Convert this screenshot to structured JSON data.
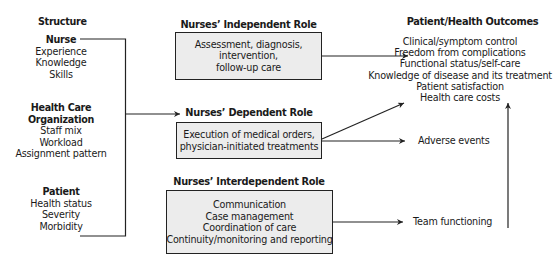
{
  "structure": {
    "heading": "Structure",
    "groups": [
      {
        "title": "Nurse",
        "items": [
          "Experience",
          "Knowledge",
          "Skills"
        ]
      },
      {
        "title_lines": [
          "Health Care",
          "Organization"
        ],
        "items": [
          "Staff mix",
          "Workload",
          "Assignment pattern"
        ]
      },
      {
        "title": "Patient",
        "items": [
          "Health status",
          "Severity",
          "Morbidity"
        ]
      }
    ]
  },
  "roles": {
    "independent": {
      "title": "Nurses’ Independent Role",
      "lines": [
        "Assessment, diagnosis,",
        "intervention,",
        "follow-up care"
      ]
    },
    "dependent": {
      "title": "Nurses’ Dependent Role",
      "lines": [
        "Execution of medical orders,",
        "physician-initiated treatments"
      ]
    },
    "interdependent": {
      "title": "Nurses’ Interdependent Role",
      "lines": [
        "Communication",
        "Case management",
        "Coordination of care",
        "Continuity/monitoring and reporting"
      ]
    }
  },
  "outcomes": {
    "heading": "Patient/Health Outcomes",
    "items": [
      "Clinical/symptom control",
      "Freedom from complications",
      "Functional status/self-care",
      "Knowledge of disease and its treatment",
      "Patient satisfaction",
      "Health care costs"
    ],
    "adverse": "Adverse events",
    "team": "Team functioning"
  },
  "colors": {
    "box_fill": "#ececec",
    "line": "#222222"
  }
}
